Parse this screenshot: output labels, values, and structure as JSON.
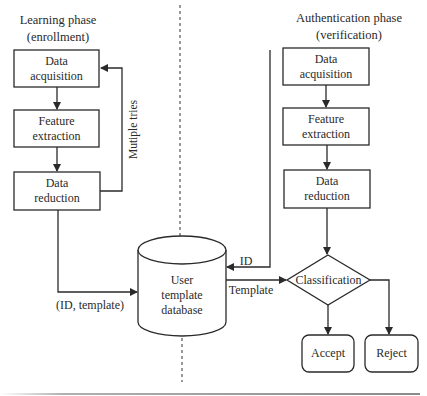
{
  "diagram": {
    "left_phase": {
      "title_line1": "Learning phase",
      "title_line2": "(enrollment)",
      "steps": [
        {
          "line1": "Data",
          "line2": "acquisition"
        },
        {
          "line1": "Feature",
          "line2": "extraction"
        },
        {
          "line1": "Data",
          "line2": "reduction"
        }
      ],
      "feedback_label": "Mutiple tries",
      "output_label": "(ID, template)"
    },
    "right_phase": {
      "title_line1": "Authentication phase",
      "title_line2": "(verification)",
      "steps": [
        {
          "line1": "Data",
          "line2": "acquisition"
        },
        {
          "line1": "Feature",
          "line2": "extraction"
        },
        {
          "line1": "Data",
          "line2": "reduction"
        }
      ],
      "id_label": "ID",
      "template_label": "Template",
      "decision": "Classification",
      "outcomes": {
        "accept": "Accept",
        "reject": "Reject"
      }
    },
    "database": {
      "line1": "User",
      "line2": "template",
      "line3": "database"
    },
    "colors": {
      "stroke": "#2a2a2a",
      "divider": "#555555",
      "rule": "#9a9a9a"
    }
  }
}
